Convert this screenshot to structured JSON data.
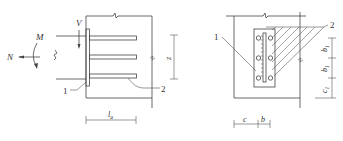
{
  "figure_left": {
    "title": "Side view of embedded plate with anchor bars",
    "labels": {
      "moment": "M",
      "normal_force": "N",
      "shear": "V",
      "lever_arm": "z",
      "anchor_length": "l",
      "anchor_length_sub": "a",
      "callout_plate": "1",
      "callout_anchor": "2"
    },
    "anchor_bar_count": 3
  },
  "figure_right": {
    "title": "Front view of embedded plate",
    "labels": {
      "callout_plate": "1",
      "callout_anchor": "2",
      "spacing_b1_top": "b",
      "spacing_b1_top_sub": "1",
      "spacing_b1_mid": "b",
      "spacing_b1_mid_sub": "1",
      "edge_c1": "c",
      "edge_c1_sub": "1",
      "edge_c": "c",
      "spacing_b": "b"
    },
    "anchor_rows": 3,
    "anchor_columns": 2
  },
  "colors": {
    "line": "#444444",
    "background": "#ffffff"
  }
}
